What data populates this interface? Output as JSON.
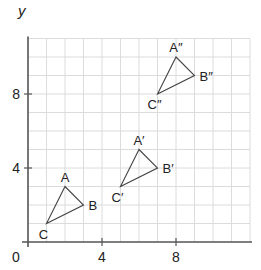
{
  "chart_data": {
    "type": "scatter",
    "title": "",
    "xlabel": "x",
    "ylabel": "y",
    "xlim": [
      0,
      12
    ],
    "ylim": [
      0,
      11
    ],
    "grid": true,
    "origin_label": "0",
    "x_ticks": [
      {
        "value": 4,
        "label": "4"
      },
      {
        "value": 8,
        "label": "8"
      }
    ],
    "y_ticks": [
      {
        "value": 4,
        "label": "4"
      },
      {
        "value": 8,
        "label": "8"
      }
    ],
    "series": [
      {
        "name": "triangle ABC",
        "points": [
          {
            "label": "A",
            "x": 2,
            "y": 3
          },
          {
            "label": "B",
            "x": 3,
            "y": 2
          },
          {
            "label": "C",
            "x": 1,
            "y": 1
          }
        ]
      },
      {
        "name": "triangle A'B'C'",
        "points": [
          {
            "label": "A′",
            "x": 6,
            "y": 5
          },
          {
            "label": "B′",
            "x": 7,
            "y": 4
          },
          {
            "label": "C′",
            "x": 5,
            "y": 3
          }
        ]
      },
      {
        "name": "triangle A''B''C''",
        "points": [
          {
            "label": "A″",
            "x": 8,
            "y": 10
          },
          {
            "label": "B″",
            "x": 9,
            "y": 9
          },
          {
            "label": "C″",
            "x": 7,
            "y": 8
          }
        ]
      }
    ]
  }
}
